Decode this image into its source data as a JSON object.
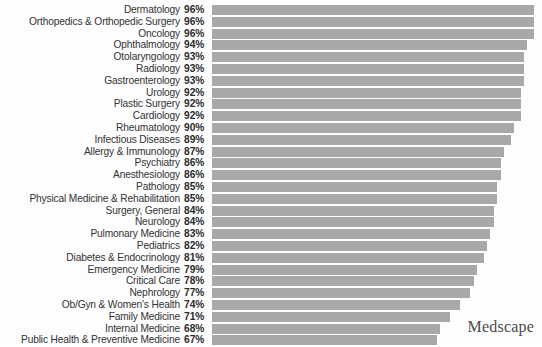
{
  "brand": {
    "name": "Medscape"
  },
  "colors": {
    "bar": "#a8a8a8",
    "background": "#fdfdfd",
    "label_text": "#333333",
    "value_text": "#2b2b2b",
    "brand_text": "#4a4a4a"
  },
  "chart_data": {
    "type": "bar",
    "orientation": "horizontal",
    "title": "",
    "subtitle": "",
    "xlabel": "",
    "ylabel": "",
    "xlim": [
      0,
      100
    ],
    "grid": false,
    "legend": null,
    "value_suffix": "%",
    "categories": [
      "Dermatology",
      "Orthopedics & Orthopedic Surgery",
      "Oncology",
      "Ophthalmology",
      "Otolaryngology",
      "Radiology",
      "Gastroenterology",
      "Urology",
      "Plastic Surgery",
      "Cardiology",
      "Rheumatology",
      "Infectious Diseases",
      "Allergy & Immunology",
      "Psychiatry",
      "Anesthesiology",
      "Pathology",
      "Physical Medicine & Rehabilitation",
      "Surgery, General",
      "Neurology",
      "Pulmonary Medicine",
      "Pediatrics",
      "Diabetes & Endocrinology",
      "Emergency Medicine",
      "Critical Care",
      "Nephrology",
      "Ob/Gyn & Women's Health",
      "Family Medicine",
      "Internal Medicine",
      "Public Health & Preventive Medicine"
    ],
    "values": [
      96,
      96,
      96,
      94,
      93,
      93,
      93,
      92,
      92,
      92,
      90,
      89,
      87,
      86,
      86,
      85,
      85,
      84,
      84,
      83,
      82,
      81,
      79,
      78,
      77,
      74,
      71,
      68,
      67
    ],
    "value_labels": [
      "96%",
      "96%",
      "96%",
      "94%",
      "93%",
      "93%",
      "93%",
      "92%",
      "92%",
      "92%",
      "90%",
      "89%",
      "87%",
      "86%",
      "86%",
      "85%",
      "85%",
      "84%",
      "84%",
      "83%",
      "82%",
      "81%",
      "79%",
      "78%",
      "77%",
      "74%",
      "71%",
      "68%",
      "67%"
    ]
  }
}
